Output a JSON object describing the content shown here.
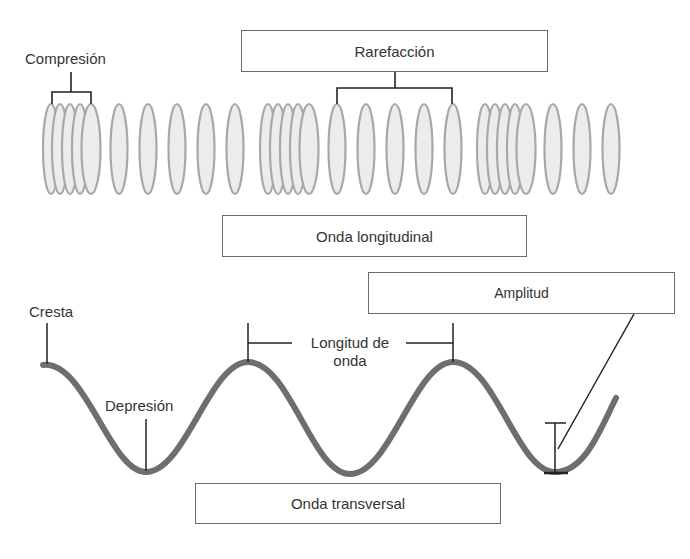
{
  "diagram": {
    "longitudinal": {
      "title": "Onda longitudinal",
      "compression_label": "Compresión",
      "rarefaction_label": "Rarefacción",
      "ellipse_groups": [
        {
          "type": "compression",
          "centers_x": [
            51,
            60,
            70,
            80,
            91
          ]
        },
        {
          "type": "rarefaction",
          "centers_x": [
            119,
            148,
            177,
            206,
            235
          ]
        },
        {
          "type": "compression",
          "centers_x": [
            268,
            278,
            288,
            298,
            309
          ]
        },
        {
          "type": "rarefaction",
          "centers_x": [
            337,
            366,
            395,
            424,
            453
          ]
        },
        {
          "type": "compression",
          "centers_x": [
            485,
            495,
            505,
            515,
            526
          ]
        },
        {
          "type": "rarefaction",
          "centers_x": [
            553,
            582,
            611
          ]
        }
      ]
    },
    "transversal": {
      "title": "Onda transversal",
      "crest_label": "Cresta",
      "trough_label": "Depresión",
      "wavelength_label_line1": "Longitud de",
      "wavelength_label_line2": "onda",
      "amplitude_label": "Amplitud"
    },
    "colors": {
      "wave_stroke": "#6e6e6e",
      "ellipse_fill": "#ececec",
      "ellipse_stroke": "#a8a8a8",
      "line": "#222222",
      "box_border": "#6a6a6a",
      "text": "#333333"
    }
  }
}
